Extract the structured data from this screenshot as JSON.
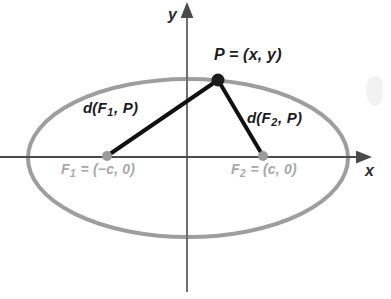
{
  "figure": {
    "type": "ellipse-foci-diagram",
    "title_text": "",
    "canvas": {
      "width": 391,
      "height": 299,
      "background": "#ffffff"
    },
    "axes": {
      "x_label": "x",
      "y_label": "y",
      "origin": {
        "x": 187,
        "y": 157
      },
      "x_axis_color": "#4a4a4a",
      "y_axis_color": "#6e6e6e",
      "x_axis_from": {
        "x": 0,
        "y": 157
      },
      "x_axis_to": {
        "x": 362,
        "y": 157
      },
      "y_axis_from": {
        "x": 187,
        "y": 292
      },
      "y_axis_to": {
        "x": 187,
        "y": 12
      }
    },
    "ellipse": {
      "center": {
        "x": 188,
        "y": 158
      },
      "rx": 160,
      "ry": 79,
      "stroke_color": "#9e9e9e",
      "stroke_width": 4,
      "fill": "none"
    },
    "points": [
      {
        "id": "P",
        "label": "P = (x, y)",
        "x": 218,
        "y": 80,
        "radius": 6,
        "color": "#1c1c1c"
      },
      {
        "id": "F1",
        "label_plain": "F1 = (-c, 0)",
        "label_prefix": "F",
        "label_subscript": "1",
        "label_suffix": " = (−c, 0)",
        "x": 107,
        "y": 156,
        "radius": 5,
        "color": "#9a9a9a"
      },
      {
        "id": "F2",
        "label_plain": "F2 = (c, 0)",
        "label_prefix": "F",
        "label_subscript": "2",
        "label_suffix": " = (c, 0)",
        "x": 263,
        "y": 156,
        "radius": 5,
        "color": "#9a9a9a"
      }
    ],
    "segments": [
      {
        "id": "d1",
        "label_prefix": "d(F",
        "label_subscript": "1",
        "label_suffix": ", P)",
        "label_plain": "d(F1, P)",
        "from": "F1",
        "to": "P",
        "color": "#111111",
        "width": 4
      },
      {
        "id": "d2",
        "label_prefix": "d(F",
        "label_subscript": "2",
        "label_suffix": ", P)",
        "label_plain": "d(F2, P)",
        "from": "F2",
        "to": "P",
        "color": "#111111",
        "width": 4
      }
    ],
    "p_label": {
      "prefix": "P = (x, y)"
    },
    "colors": {
      "dark_text": "#1c1c1c",
      "gray_text": "#a8a8a8",
      "ellipse": "#9e9e9e",
      "axis": "#4a4a4a",
      "segment": "#111111",
      "focus_dot": "#9a9a9a",
      "point_dot": "#1c1c1c",
      "background": "#ffffff"
    }
  }
}
